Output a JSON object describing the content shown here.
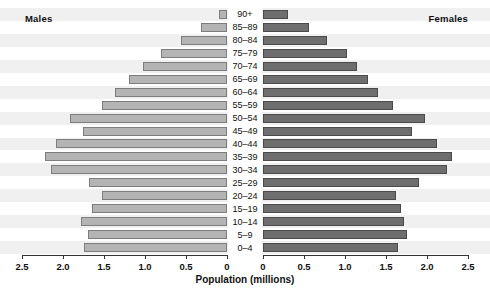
{
  "chart_data": {
    "type": "bar",
    "subtype": "population-pyramid",
    "title": "",
    "xlabel": "Population (millions)",
    "ylabel": "",
    "categories": [
      "90+",
      "85–89",
      "80–84",
      "75–79",
      "70–74",
      "65–69",
      "60–64",
      "55–59",
      "50–54",
      "45–49",
      "40–44",
      "35–39",
      "30–34",
      "25–29",
      "20–24",
      "15–19",
      "10–14",
      "5–9",
      "0–4"
    ],
    "series": [
      {
        "name": "Males",
        "side": "left",
        "color": "#b4b4b4",
        "values": [
          0.1,
          0.32,
          0.56,
          0.8,
          1.02,
          1.2,
          1.36,
          1.52,
          1.92,
          1.76,
          2.08,
          2.22,
          2.15,
          1.68,
          1.53,
          1.65,
          1.78,
          1.7,
          1.74
        ]
      },
      {
        "name": "Females",
        "side": "right",
        "color": "#6e6e6e",
        "values": [
          0.3,
          0.56,
          0.78,
          1.02,
          1.15,
          1.28,
          1.4,
          1.58,
          1.98,
          1.82,
          2.12,
          2.3,
          2.24,
          1.9,
          1.62,
          1.68,
          1.72,
          1.75,
          1.65
        ]
      }
    ],
    "xlim_left": [
      2.5,
      0
    ],
    "xlim_right": [
      0,
      2.5
    ],
    "xticks_left": [
      "2.5",
      "2.0",
      "1.5",
      "1.0",
      "0.5",
      "0"
    ],
    "xticks_right": [
      "0",
      "0.5",
      "1.0",
      "1.5",
      "2.0",
      "2.5"
    ],
    "grid": false,
    "row_banding": true,
    "legend": "inline-corner-labels"
  },
  "labels": {
    "males": "Males",
    "females": "Females",
    "xtitle": "Population (millions)"
  },
  "colors": {
    "male_bar": "#b4b4b4",
    "male_border": "#7d7d7d",
    "female_bar": "#6e6e6e",
    "female_border": "#4a4a4a",
    "band_alt": "#f0f0f0",
    "axis": "#333333",
    "text": "#111111"
  }
}
